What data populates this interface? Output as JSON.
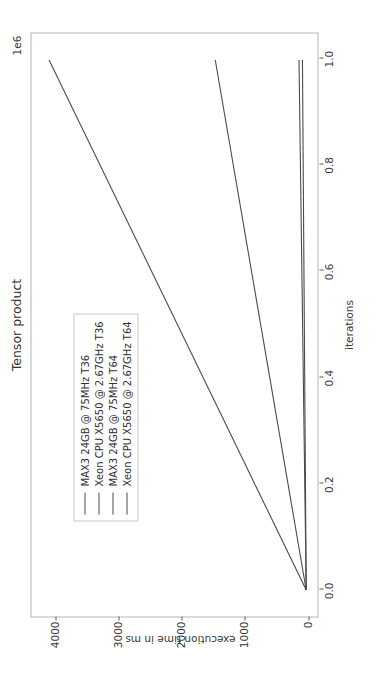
{
  "chart_data": {
    "type": "line",
    "title": "Tensor product",
    "xlabel": "iterations",
    "ylabel": "execution time in ms",
    "x_offset_text": "1e6",
    "xlim": [
      -0.05,
      1.05
    ],
    "ylim": [
      -180,
      4380
    ],
    "xticks": [
      0.0,
      0.2,
      0.4,
      0.6,
      0.8,
      1.0
    ],
    "xticklabels": [
      "0.0",
      "0.2",
      "0.4",
      "0.6",
      "0.8",
      "1.0"
    ],
    "yticks": [
      0,
      1000,
      2000,
      3000,
      4000
    ],
    "yticklabels": [
      "0",
      "1000",
      "2000",
      "3000",
      "4000"
    ],
    "grid": false,
    "legend_position": "upper left",
    "x": [
      0,
      1000000
    ],
    "series": [
      {
        "name": "MAX3 24GB @ 75MHz T36",
        "values": [
          0,
          4100
        ],
        "color": "#4a4a4a"
      },
      {
        "name": "Xeon CPU X5650 @ 2.67GHz T36",
        "values": [
          0,
          1450
        ],
        "color": "#4a4a4a"
      },
      {
        "name": "MAX3 24GB @ 75MHz T64",
        "values": [
          0,
          115
        ],
        "color": "#4a4a4a"
      },
      {
        "name": "Xeon CPU X5650 @ 2.67GHz T64",
        "values": [
          0,
          60
        ],
        "color": "#4a4a4a"
      }
    ]
  }
}
